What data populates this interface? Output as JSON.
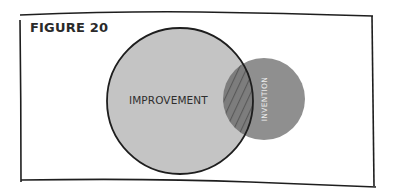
{
  "figure": {
    "title": "FIGURE 20",
    "circles": [
      {
        "label": "IMPROVEMENT",
        "color": "#c4c4c4",
        "outline": "#1e1e1e"
      },
      {
        "label": "INVENTION",
        "color": "#8f8f8f",
        "outline": "none"
      }
    ],
    "overlap": {
      "pattern": "diagonal-hatch",
      "fill": "#7d7d7d",
      "hatch_color": "#5e5e5e"
    },
    "frame_color": "#1e1e1e"
  }
}
